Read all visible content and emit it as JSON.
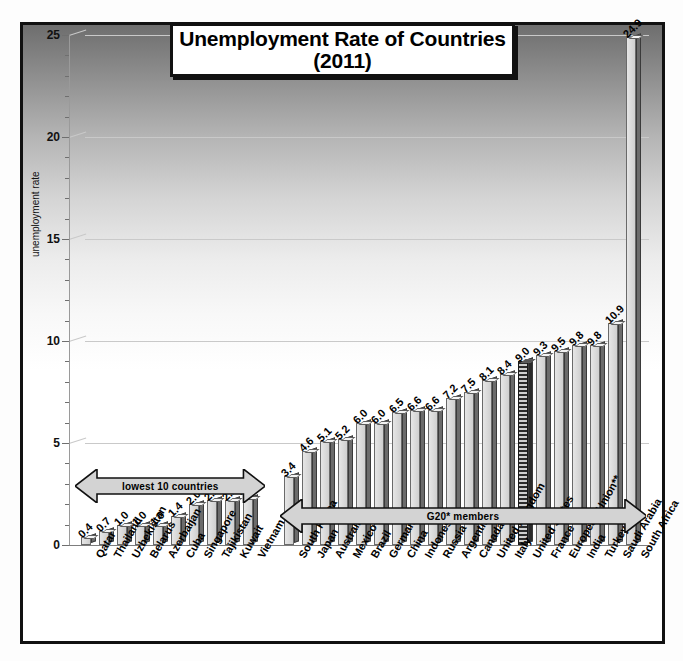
{
  "chart_data": {
    "type": "bar",
    "title": "Unemployment Rate of Countries",
    "subtitle": "(2011)",
    "xlabel": "",
    "ylabel": "unemployment rate",
    "ylim": [
      0,
      25
    ],
    "yticks": [
      0,
      5,
      10,
      15,
      20,
      25
    ],
    "grid": true,
    "legend": "none",
    "categories": [
      "Qatar",
      "Thailand",
      "Uzbekistan",
      "Belarus",
      "Azerbaijan",
      "Cuba",
      "Singapore",
      "Tajikistan",
      "Kuwait",
      "Vietnam",
      "South Korea",
      "Japan",
      "Australia",
      "Mexico",
      "Brazil",
      "Germany",
      "China",
      "Indonesia",
      "Russia",
      "Argentina",
      "Canada",
      "United Kingdom",
      "Italy",
      "United States",
      "France",
      "European Union**",
      "India",
      "Turkey",
      "Saudi Arabia",
      "South Africa"
    ],
    "values": [
      0.4,
      0.7,
      1.0,
      1.0,
      1.0,
      1.4,
      2.0,
      2.2,
      2.2,
      2.3,
      3.4,
      4.6,
      5.1,
      5.2,
      6.0,
      6.0,
      6.5,
      6.6,
      6.6,
      7.2,
      7.5,
      8.1,
      8.4,
      9.0,
      9.3,
      9.5,
      9.8,
      9.8,
      10.9,
      24.9
    ],
    "value_labels": [
      "0.4",
      "0.7",
      "1.0",
      "1.0",
      "1.0",
      "1.4",
      "2.0",
      "2.2",
      "2.2",
      "2.3",
      "3.4",
      "4.6",
      "5.1",
      "5.2",
      "6.0",
      "6.0",
      "6.5",
      "6.6",
      "6.6",
      "7.2",
      "7.5",
      "8.1",
      "8.4",
      "9.0",
      "9.3",
      "9.5",
      "9.8",
      "9.8",
      "10.9",
      "24.9"
    ],
    "highlighted_index": 23,
    "annotations": [
      {
        "name": "lowest-10-countries",
        "text": "lowest 10 countries",
        "span": [
          0,
          9
        ]
      },
      {
        "name": "g20-members",
        "text": "G20* members",
        "span": [
          10,
          29
        ]
      }
    ]
  },
  "colors": {
    "bar_front": "#dcdcdc",
    "bar_side": "#6b6b6b",
    "highlight": "#2b2b2b",
    "grid": "#c9c9c9",
    "frame": "#111111",
    "text": "#000000"
  }
}
